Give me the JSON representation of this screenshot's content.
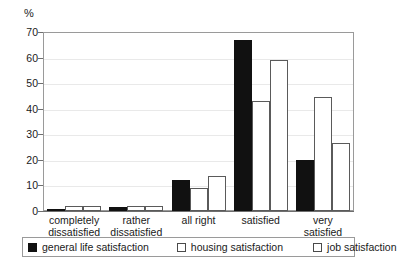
{
  "chart_data": {
    "type": "bar",
    "title": "",
    "xlabel": "",
    "ylabel": "%",
    "ylim": [
      0,
      70
    ],
    "yticks": [
      0,
      10,
      20,
      30,
      40,
      50,
      60,
      70
    ],
    "grid": true,
    "legend_position": "bottom",
    "categories": [
      "completely dissatisfied",
      "rather dissatisfied",
      "all right",
      "satisfied",
      "very satisfied"
    ],
    "category_lines": [
      [
        "completely",
        "dissatisfied"
      ],
      [
        "rather",
        "dissatisfied"
      ],
      [
        "all right",
        ""
      ],
      [
        "satisfied",
        ""
      ],
      [
        "very",
        "satisfied"
      ]
    ],
    "series": [
      {
        "name": "general life satisfaction",
        "color": "#111111",
        "style": "filled",
        "values": [
          0.5,
          1.5,
          12,
          67,
          20
        ]
      },
      {
        "name": "housing satisfaction",
        "color": "#ffffff",
        "style": "outlined",
        "values": [
          2,
          2,
          9,
          43,
          44.5
        ]
      },
      {
        "name": "job satisfaction",
        "color": "#ffffff",
        "style": "outlined",
        "values": [
          2,
          2,
          13.5,
          59,
          26.5
        ]
      }
    ]
  }
}
